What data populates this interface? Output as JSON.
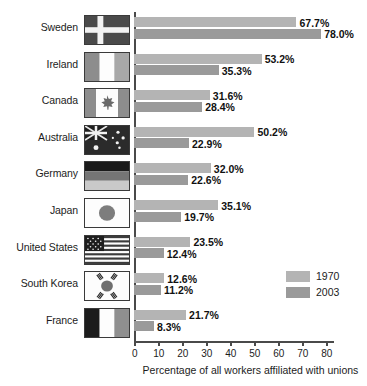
{
  "chart_data": {
    "type": "bar",
    "orientation": "horizontal",
    "title": "",
    "xlabel": "Percentage of all workers affiliated with unions",
    "ylabel": "",
    "xlim": [
      0,
      85
    ],
    "xticks": [
      0,
      10,
      20,
      30,
      40,
      50,
      60,
      70,
      80
    ],
    "grid": false,
    "legend_position": "inside-right-lower",
    "categories": [
      "Sweden",
      "Ireland",
      "Canada",
      "Australia",
      "Germany",
      "Japan",
      "United States",
      "South Korea",
      "France"
    ],
    "series": [
      {
        "name": "1970",
        "color": "#b4b4b4",
        "values": [
          67.7,
          53.2,
          31.6,
          50.2,
          32.0,
          35.1,
          23.5,
          12.6,
          21.7
        ],
        "labels": [
          "67.7%",
          "53.2%",
          "31.6%",
          "50.2%",
          "32.0%",
          "35.1%",
          "23.5%",
          "12.6%",
          "21.7%"
        ]
      },
      {
        "name": "2003",
        "color": "#9a9a9a",
        "values": [
          78.0,
          35.3,
          28.4,
          22.9,
          22.6,
          19.7,
          12.4,
          11.2,
          8.3
        ],
        "labels": [
          "78.0%",
          "35.3%",
          "28.4%",
          "22.9%",
          "22.6%",
          "19.7%",
          "12.4%",
          "11.2%",
          "8.3%"
        ]
      }
    ]
  },
  "rows": [
    {
      "country": "Sweden",
      "flag": "flag-sweden",
      "v1970": "67.7%",
      "v2003": "78.0%"
    },
    {
      "country": "Ireland",
      "flag": "flag-ireland",
      "v1970": "53.2%",
      "v2003": "35.3%"
    },
    {
      "country": "Canada",
      "flag": "flag-canada",
      "v1970": "31.6%",
      "v2003": "28.4%"
    },
    {
      "country": "Australia",
      "flag": "flag-australia",
      "v1970": "50.2%",
      "v2003": "22.9%"
    },
    {
      "country": "Germany",
      "flag": "flag-germany",
      "v1970": "32.0%",
      "v2003": "22.6%"
    },
    {
      "country": "Japan",
      "flag": "flag-japan",
      "v1970": "35.1%",
      "v2003": "19.7%"
    },
    {
      "country": "United States",
      "flag": "flag-united-states",
      "v1970": "23.5%",
      "v2003": "12.4%"
    },
    {
      "country": "South Korea",
      "flag": "flag-south-korea",
      "v1970": "12.6%",
      "v2003": "11.2%"
    },
    {
      "country": "France",
      "flag": "flag-france",
      "v1970": "21.7%",
      "v2003": "8.3%"
    }
  ],
  "axis": {
    "ticks": [
      "0",
      "10",
      "20",
      "30",
      "40",
      "50",
      "60",
      "70",
      "80"
    ],
    "title": "Percentage of all workers affiliated with unions"
  },
  "legend": {
    "items": [
      {
        "label": "1970",
        "color": "#b4b4b4"
      },
      {
        "label": "2003",
        "color": "#9a9a9a"
      }
    ]
  }
}
